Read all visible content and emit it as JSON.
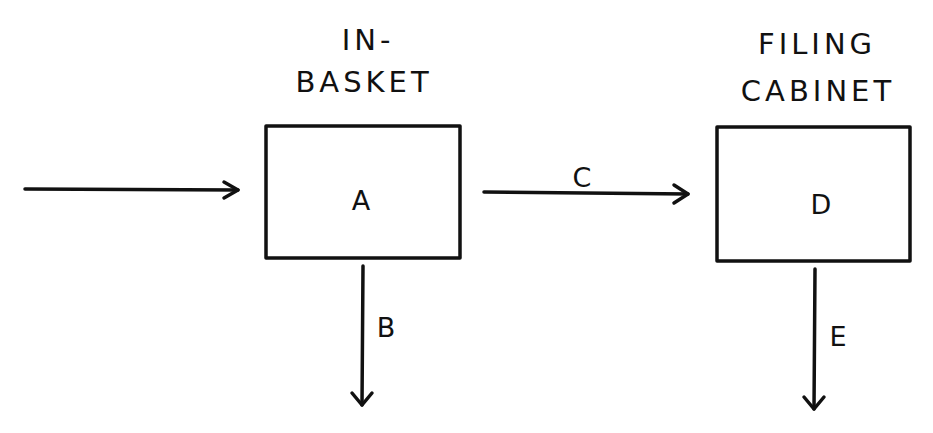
{
  "diagram": {
    "colors": {
      "stroke": "#111111",
      "background": "#ffffff"
    },
    "nodes": [
      {
        "id": "A",
        "letter": "A",
        "title_line1": "IN-",
        "title_line2": "BASKET"
      },
      {
        "id": "D",
        "letter": "D",
        "title_line1": "FILING",
        "title_line2": "CABINET"
      }
    ],
    "edges": [
      {
        "id": "input",
        "from": "outside",
        "to": "A",
        "label": ""
      },
      {
        "id": "B",
        "from": "A",
        "to": "outside-down",
        "label": "B"
      },
      {
        "id": "C",
        "from": "A",
        "to": "D",
        "label": "C"
      },
      {
        "id": "E",
        "from": "D",
        "to": "outside-down",
        "label": "E"
      }
    ]
  }
}
